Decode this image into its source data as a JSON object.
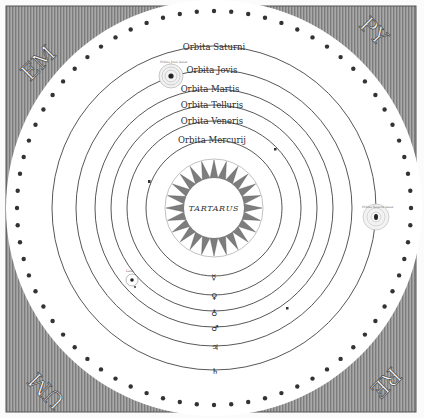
{
  "diagram": {
    "type": "geocentric-cosmology-engraving",
    "corners": {
      "top_left": "EM",
      "top_right": "PY",
      "bottom_right": "RE",
      "bottom_left": "UM"
    },
    "orbits": [
      {
        "label": "Orbita Saturni",
        "symbol": "♄",
        "radius": 162
      },
      {
        "label": "Orbita Jovis",
        "symbol": "♃",
        "radius": 138
      },
      {
        "label": "Orbita Martis",
        "symbol": "♂",
        "radius": 119
      },
      {
        "label": "Orbita Telluris",
        "symbol": "♁",
        "radius": 103
      },
      {
        "label": "Orbita Veneris",
        "symbol": "♀",
        "radius": 87
      },
      {
        "label": "Orbita Mercurij",
        "symbol": "☿",
        "radius": 68
      }
    ],
    "center": {
      "label": "TARTARUS"
    },
    "planet_annotations": {
      "jupiter_moons": "Orbita Jovis lunae",
      "saturn_moons": "Orbita Saturni lunae",
      "earth_moon": "Luna"
    },
    "colors": {
      "ink": "#2a2a2a",
      "paper": "#ffffff",
      "hatching": "#8a8a8a",
      "dots": "#3a3a3a"
    }
  }
}
